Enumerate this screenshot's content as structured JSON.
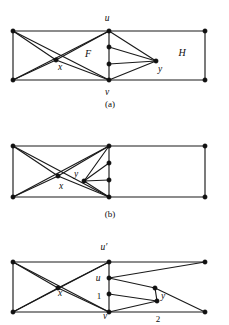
{
  "figure": {
    "kind": "graph-diagram-figure",
    "background_color": "#ffffff",
    "ink_color": "#111111",
    "panels": [
      {
        "id": "a",
        "caption": "(a)",
        "caption_pos": {
          "x": 110,
          "y": 107
        },
        "region_labels": [
          {
            "name": "F",
            "text": "F",
            "x": 88,
            "y": 57
          },
          {
            "name": "H",
            "text": "H",
            "x": 182,
            "y": 56
          }
        ],
        "vertex_labels": [
          {
            "name": "u",
            "text": "u",
            "x": 107,
            "y": 21
          },
          {
            "name": "v",
            "text": "v",
            "x": 107,
            "y": 95
          },
          {
            "name": "x",
            "text": "x",
            "x": 60,
            "y": 70
          },
          {
            "name": "y",
            "text": "y",
            "x": 160,
            "y": 72
          }
        ],
        "nodes": [
          {
            "name": "top-left",
            "x": 13,
            "y": 31
          },
          {
            "name": "bottom-left",
            "x": 13,
            "y": 80
          },
          {
            "name": "x",
            "x": 56,
            "y": 60
          },
          {
            "name": "u",
            "x": 109,
            "y": 31
          },
          {
            "name": "v",
            "x": 109,
            "y": 80
          },
          {
            "name": "mid-upper",
            "x": 109,
            "y": 47
          },
          {
            "name": "mid-lower",
            "x": 109,
            "y": 64
          },
          {
            "name": "y",
            "x": 156,
            "y": 61
          },
          {
            "name": "top-right",
            "x": 205,
            "y": 31
          },
          {
            "name": "bottom-right",
            "x": 205,
            "y": 80
          }
        ],
        "edges": [
          [
            "top-left",
            "bottom-left"
          ],
          [
            "top-left",
            "u"
          ],
          [
            "bottom-left",
            "v"
          ],
          [
            "top-left",
            "x"
          ],
          [
            "bottom-left",
            "x"
          ],
          [
            "x",
            "u"
          ],
          [
            "x",
            "v"
          ],
          [
            "top-left",
            "v"
          ],
          [
            "bottom-left",
            "u"
          ],
          [
            "u",
            "mid-upper"
          ],
          [
            "mid-upper",
            "mid-lower"
          ],
          [
            "mid-lower",
            "v"
          ],
          [
            "u",
            "y"
          ],
          [
            "mid-upper",
            "y"
          ],
          [
            "mid-lower",
            "y"
          ],
          [
            "v",
            "y"
          ],
          [
            "u",
            "top-right"
          ],
          [
            "v",
            "bottom-right"
          ],
          [
            "top-right",
            "bottom-right"
          ]
        ]
      },
      {
        "id": "b",
        "caption": "(b)",
        "caption_pos": {
          "x": 110,
          "y": 217
        },
        "region_labels": [],
        "vertex_labels": [
          {
            "name": "x",
            "text": "x",
            "x": 61,
            "y": 189
          },
          {
            "name": "y",
            "text": "y",
            "x": 76,
            "y": 177
          }
        ],
        "nodes": [
          {
            "name": "top-left",
            "x": 13,
            "y": 146
          },
          {
            "name": "bottom-left",
            "x": 13,
            "y": 197
          },
          {
            "name": "x",
            "x": 58,
            "y": 176
          },
          {
            "name": "y",
            "x": 84,
            "y": 181
          },
          {
            "name": "u",
            "x": 109,
            "y": 146
          },
          {
            "name": "v",
            "x": 109,
            "y": 197
          },
          {
            "name": "mid-upper",
            "x": 109,
            "y": 163
          },
          {
            "name": "mid-lower",
            "x": 109,
            "y": 180
          },
          {
            "name": "top-right",
            "x": 205,
            "y": 146
          },
          {
            "name": "bottom-right",
            "x": 205,
            "y": 197
          }
        ],
        "edges": [
          [
            "top-left",
            "bottom-left"
          ],
          [
            "top-left",
            "u"
          ],
          [
            "bottom-left",
            "v"
          ],
          [
            "top-left",
            "x"
          ],
          [
            "bottom-left",
            "x"
          ],
          [
            "top-left",
            "v"
          ],
          [
            "bottom-left",
            "u"
          ],
          [
            "x",
            "u"
          ],
          [
            "x",
            "v"
          ],
          [
            "u",
            "mid-upper"
          ],
          [
            "mid-upper",
            "mid-lower"
          ],
          [
            "mid-lower",
            "v"
          ],
          [
            "y",
            "u"
          ],
          [
            "y",
            "mid-upper"
          ],
          [
            "y",
            "mid-lower"
          ],
          [
            "y",
            "v"
          ],
          [
            "u",
            "top-right"
          ],
          [
            "v",
            "bottom-right"
          ],
          [
            "top-right",
            "bottom-right"
          ]
        ]
      },
      {
        "id": "c",
        "caption": "",
        "caption_pos": {
          "x": 110,
          "y": 327
        },
        "region_labels": [],
        "vertex_labels": [
          {
            "name": "u-prime",
            "text": "u′",
            "x": 104,
            "y": 250
          },
          {
            "name": "u",
            "text": "u",
            "x": 98,
            "y": 281
          },
          {
            "name": "v",
            "text": "v",
            "x": 105,
            "y": 319
          },
          {
            "name": "x",
            "text": "x",
            "x": 60,
            "y": 296
          },
          {
            "name": "y",
            "text": "y",
            "x": 163,
            "y": 299
          }
        ],
        "number_labels": [
          {
            "name": "one",
            "text": "1",
            "x": 99,
            "y": 299
          },
          {
            "name": "two",
            "text": "2",
            "x": 158,
            "y": 322
          }
        ],
        "nodes": [
          {
            "name": "top-left",
            "x": 13,
            "y": 262
          },
          {
            "name": "bottom-left",
            "x": 13,
            "y": 312
          },
          {
            "name": "x",
            "x": 58,
            "y": 288
          },
          {
            "name": "u-prime",
            "x": 109,
            "y": 262
          },
          {
            "name": "u",
            "x": 109,
            "y": 278
          },
          {
            "name": "one",
            "x": 109,
            "y": 294
          },
          {
            "name": "v",
            "x": 109,
            "y": 312
          },
          {
            "name": "y",
            "x": 157,
            "y": 301
          },
          {
            "name": "mid-upper-right",
            "x": 155,
            "y": 288
          },
          {
            "name": "top-right",
            "x": 205,
            "y": 262
          },
          {
            "name": "bottom-right",
            "x": 205,
            "y": 312
          }
        ],
        "edges": [
          [
            "top-left",
            "bottom-left"
          ],
          [
            "top-left",
            "u-prime"
          ],
          [
            "bottom-left",
            "v"
          ],
          [
            "top-left",
            "x"
          ],
          [
            "bottom-left",
            "x"
          ],
          [
            "top-left",
            "v"
          ],
          [
            "bottom-left",
            "u-prime"
          ],
          [
            "x",
            "u-prime"
          ],
          [
            "x",
            "v"
          ],
          [
            "u-prime",
            "u"
          ],
          [
            "u",
            "one"
          ],
          [
            "one",
            "v"
          ],
          [
            "u-prime",
            "top-right"
          ],
          [
            "u",
            "top-right"
          ],
          [
            "u",
            "mid-upper-right"
          ],
          [
            "one",
            "y"
          ],
          [
            "mid-upper-right",
            "y"
          ],
          [
            "mid-upper-right",
            "bottom-right"
          ],
          [
            "y",
            "v"
          ],
          [
            "v",
            "bottom-right"
          ]
        ]
      }
    ]
  }
}
